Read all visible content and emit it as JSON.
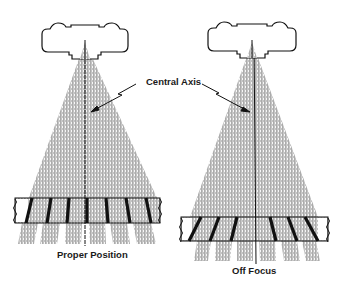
{
  "diagram": {
    "labels": {
      "central_axis": "Central Axis",
      "left_caption": "Proper Position",
      "right_caption": "Off Focus"
    },
    "panels": [
      {
        "name": "proper-position",
        "caption_key": "left_caption",
        "grid_alignment": "aligned"
      },
      {
        "name": "off-focus",
        "caption_key": "right_caption",
        "grid_alignment": "misaligned"
      }
    ],
    "colors": {
      "ink": "#111111",
      "beam": "#9a9a9a",
      "background": "#ffffff"
    }
  }
}
